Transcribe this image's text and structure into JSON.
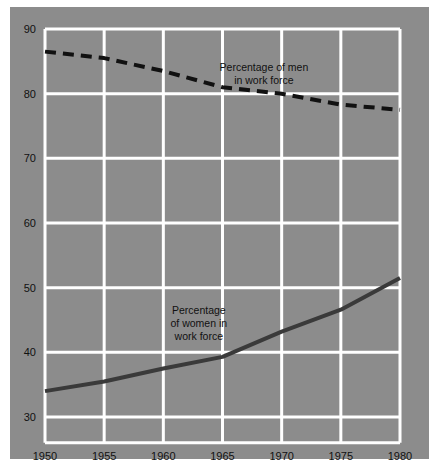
{
  "chart_data": {
    "type": "line",
    "title": "",
    "subtitle": "",
    "xlabel": "",
    "ylabel": "",
    "xlim": [
      1950,
      1980
    ],
    "ylim": [
      26,
      90
    ],
    "grid": true,
    "legend_position": "inline-annotations",
    "xticks": [
      1950,
      1955,
      1960,
      1965,
      1970,
      1975,
      1980
    ],
    "xtick_labels": [
      "1950",
      "1955",
      "1960",
      "1965",
      "1970",
      "1975",
      "1980"
    ],
    "yticks": [
      30,
      40,
      50,
      60,
      70,
      80,
      90
    ],
    "ytick_labels": [
      "30",
      "40",
      "50",
      "60",
      "70",
      "80",
      "90"
    ],
    "x": [
      1950,
      1955,
      1960,
      1965,
      1970,
      1975,
      1980
    ],
    "series": [
      {
        "name": "Percentage of men in work force",
        "style": "dashed",
        "color": "#111111",
        "values": [
          86.5,
          85.5,
          83.5,
          81.0,
          80.0,
          78.3,
          77.5
        ]
      },
      {
        "name": "Percentage of women in work force",
        "style": "solid",
        "color": "#3a3a3a",
        "values": [
          34.0,
          35.5,
          37.5,
          39.3,
          43.2,
          46.6,
          51.5
        ]
      }
    ],
    "annotations": [
      {
        "id": "men-label",
        "lines": [
          "Percentage of men",
          "in work force"
        ],
        "x": 1968.5,
        "y": 83.5
      },
      {
        "id": "women-label",
        "lines": [
          "Percentage",
          "of women in",
          "work force"
        ],
        "x": 1963.0,
        "y": 46.0
      }
    ],
    "colors": {
      "panel_background": "#8c8c8c",
      "gridline": "#ffffff",
      "men_line": "#111111",
      "women_line": "#3a3a3a",
      "text": "#111111",
      "page_background": "#ffffff"
    }
  }
}
